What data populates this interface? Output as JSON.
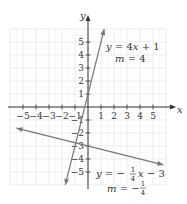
{
  "chart_data": {
    "type": "line",
    "title": "",
    "xlabel": "x",
    "ylabel": "y",
    "xlim": [
      -6,
      6
    ],
    "ylim": [
      -6,
      6
    ],
    "grid": true,
    "x_ticks": [
      -5,
      -4,
      -3,
      -2,
      -1,
      1,
      2,
      3,
      4,
      5
    ],
    "y_ticks": [
      -5,
      -4,
      -3,
      -2,
      -1,
      1,
      2,
      3,
      4,
      5
    ],
    "x_tick_labels": [
      "−5",
      "−4",
      "−3",
      "−2",
      "−1",
      "1",
      "2",
      "3",
      "4",
      "5"
    ],
    "y_tick_labels": [
      "−5",
      "−4",
      "−3",
      "−2",
      "−1",
      "1",
      "2",
      "3",
      "4",
      "5"
    ],
    "series": [
      {
        "name": "y = 4x + 1",
        "equation": "y = 4x + 1",
        "slope_label": "m = 4",
        "slope": 4,
        "intercept": 1,
        "x": [
          -1.75,
          1.25
        ],
        "y": [
          -6,
          6
        ],
        "color": "#777777"
      },
      {
        "name": "y = −1/4 x − 3",
        "equation": "y = −(1/4)x − 3",
        "slope_label": "m = −1/4",
        "slope": -0.25,
        "intercept": -3,
        "x": [
          -5.5,
          5.8
        ],
        "y": [
          -1.625,
          -4.45
        ],
        "color": "#777777"
      }
    ],
    "annotations": [
      {
        "text": "y = 4x + 1",
        "near": [
          2.3,
          4.5
        ]
      },
      {
        "text": "m = 4",
        "near": [
          2.8,
          3.6
        ]
      },
      {
        "text": "y = −1/4 x − 3",
        "near": [
          1.0,
          -5.2
        ]
      },
      {
        "text": "m = −1/4",
        "near": [
          2.0,
          -6.0
        ]
      }
    ]
  },
  "labels": {
    "x_axis": "x",
    "y_axis": "y",
    "line1": {
      "y": "y",
      "eq": "=",
      "rhs1": "4",
      "x": "x",
      "rhs2": "+ 1",
      "m": "m",
      "meq": "= 4"
    },
    "line2": {
      "y": "y",
      "eq": "= −",
      "num": "1",
      "den": "4",
      "x": "x",
      "rhs": "− 3",
      "m": "m",
      "meq": "= −"
    }
  },
  "colors": {
    "grid": "#e4e4e4",
    "axis": "#333333",
    "line": "#7a7a7a",
    "text": "#333333"
  }
}
